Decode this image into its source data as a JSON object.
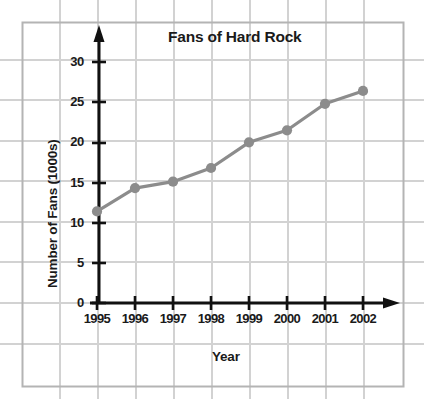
{
  "chart_data": {
    "type": "line",
    "title": "Fans of Hard Rock",
    "xlabel": "Year",
    "ylabel": "Number of Fans (1000s)",
    "categories": [
      "1995",
      "1996",
      "1997",
      "1998",
      "1999",
      "2000",
      "2001",
      "2002"
    ],
    "x": [
      1995,
      1996,
      1997,
      1998,
      1999,
      2000,
      2001,
      2002
    ],
    "values": [
      11.4,
      14.3,
      15.1,
      16.8,
      20.0,
      21.5,
      24.8,
      26.4
    ],
    "series": [
      {
        "name": "Fans of Hard Rock",
        "values": [
          11.4,
          14.3,
          15.1,
          16.8,
          20.0,
          21.5,
          24.8,
          26.4
        ]
      }
    ],
    "ylim": [
      0,
      32
    ],
    "xlim": [
      1994.6,
      2002.8
    ],
    "yticks": [
      "0",
      "5",
      "10",
      "15",
      "20",
      "25",
      "30"
    ],
    "ytick_values": [
      0,
      5,
      10,
      15,
      20,
      25,
      30
    ],
    "grid": true,
    "legend": null,
    "legend_position": "none",
    "marker": "circle",
    "line_color": "#8c8c8c",
    "marker_color": "#8c8c8c",
    "axis_color": "#000000",
    "grid_color": "#c9c9c9",
    "background_color": "#ffffff",
    "axis_arrows": true
  },
  "axis_titles": {
    "y": "Number of Fans (1000s)",
    "x": "Year"
  },
  "title": "Fans of Hard Rock"
}
